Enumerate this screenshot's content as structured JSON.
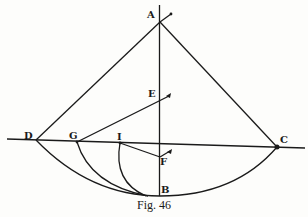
{
  "figure": {
    "caption": "Fig. 46",
    "ink_color": "#1a1a1a",
    "paper_color": "#fdfdfb",
    "points": {
      "A": {
        "label": "A",
        "x": 160,
        "y": 22
      },
      "B": {
        "label": "B",
        "x": 160,
        "y": 196
      },
      "C": {
        "label": "C",
        "x": 277,
        "y": 147
      },
      "D": {
        "label": "D",
        "x": 36,
        "y": 140
      },
      "E": {
        "label": "E",
        "x": 160,
        "y": 100
      },
      "F": {
        "label": "F",
        "x": 160,
        "y": 157
      },
      "G": {
        "label": "G",
        "x": 77,
        "y": 142
      },
      "I": {
        "label": "I",
        "x": 120,
        "y": 143
      }
    }
  }
}
